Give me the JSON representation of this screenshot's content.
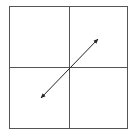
{
  "diagram": {
    "type": "quadrant-grid-with-double-arrow",
    "colors": {
      "background": "#ffffff",
      "grid_line": "#555555",
      "arrow": "#222222"
    },
    "frame": {
      "x": 9,
      "y": 6,
      "width": 118,
      "height": 122
    },
    "center": {
      "x": 69,
      "y": 67
    },
    "arrow": {
      "start": {
        "x": 41,
        "y": 98
      },
      "end": {
        "x": 98,
        "y": 39
      },
      "heads": "both"
    }
  }
}
